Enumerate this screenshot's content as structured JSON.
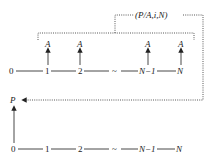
{
  "diagram": {
    "type": "cash-flow-diagram",
    "factor_label": "(P/A,i,N)",
    "present_value_label": "P",
    "annuity_label": "A",
    "top_timeline": {
      "ticks": [
        "0",
        "1",
        "2",
        "~",
        "N−1",
        "N"
      ],
      "payments_at": [
        "1",
        "2",
        "N−1",
        "N"
      ]
    },
    "bottom_timeline": {
      "ticks": [
        "0",
        "1",
        "2",
        "~",
        "N−1",
        "N"
      ]
    },
    "colors": {
      "line": "#333333",
      "background": "#ffffff"
    }
  }
}
